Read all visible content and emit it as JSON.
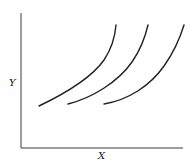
{
  "diagram": {
    "axes": {
      "x_label": "X",
      "y_label": "Y"
    },
    "curves": [
      {
        "name": "curve-1",
        "path": "M39,106 C62,95 90,80 104,60 C112,48 115,38 116,25"
      },
      {
        "name": "curve-2",
        "path": "M68,104 C92,98 118,82 132,62 C141,49 145,38 148,25"
      },
      {
        "name": "curve-3",
        "path": "M104,104 C128,100 150,86 164,66 C174,52 180,38 184,25"
      }
    ],
    "colors": {
      "line": "#222222",
      "axis": "#3a3a3a",
      "background": "#ffffff"
    }
  }
}
